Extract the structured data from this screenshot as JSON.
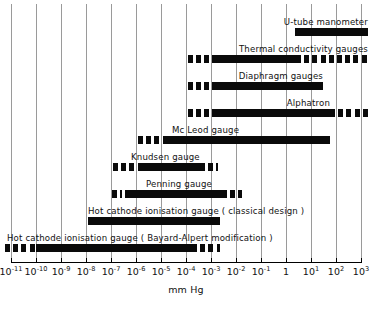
{
  "chart_data": {
    "type": "bar",
    "title": "",
    "subtitle": "",
    "xlabel": "mm Hg",
    "ylabel": "",
    "orientation": "horizontal",
    "xscale": "log",
    "xlim": [
      1e-11,
      1000.0
    ],
    "grid": true,
    "legend": "none",
    "x_ticks": [
      {
        "label": "10",
        "exponent": "-11",
        "value": 1e-11,
        "px": 11
      },
      {
        "label": "10",
        "exponent": "-10",
        "value": 1e-10,
        "px": 36
      },
      {
        "label": "10",
        "exponent": "-9",
        "value": 1e-09,
        "px": 61
      },
      {
        "label": "10",
        "exponent": "-8",
        "value": 1e-08,
        "px": 86
      },
      {
        "label": "10",
        "exponent": "-7",
        "value": 1e-07,
        "px": 111
      },
      {
        "label": "10",
        "exponent": "-6",
        "value": 1e-06,
        "px": 136
      },
      {
        "label": "10",
        "exponent": "-5",
        "value": 1e-05,
        "px": 161
      },
      {
        "label": "10",
        "exponent": "-4",
        "value": 0.0001,
        "px": 186
      },
      {
        "label": "10",
        "exponent": "-3",
        "value": 0.001,
        "px": 211
      },
      {
        "label": "10",
        "exponent": "-2",
        "value": 0.01,
        "px": 236
      },
      {
        "label": "10",
        "exponent": "-1",
        "value": 0.1,
        "px": 261
      },
      {
        "label": "1",
        "exponent": "",
        "value": 1,
        "px": 286
      },
      {
        "label": "10",
        "exponent": "1",
        "value": 10,
        "px": 311
      },
      {
        "label": "10",
        "exponent": "2",
        "value": 100,
        "px": 336
      },
      {
        "label": "10",
        "exponent": "3",
        "value": 1000,
        "px": 361
      }
    ],
    "series": [
      {
        "name": "U-tube manometer",
        "label": "U-tube manometer",
        "label_align": "right",
        "label_px": 368,
        "row_top": 14,
        "range_solid": [
          0.36,
          1000
        ],
        "range_dashed_low": null,
        "range_dashed_high": null,
        "solid_px": [
          295,
          368
        ],
        "dash_low_px": null,
        "dash_high_px": null
      },
      {
        "name": "Thermal conductivity gauges",
        "label": "Thermal conductivity gauges",
        "label_align": "right",
        "label_px": 368,
        "row_top": 41,
        "range_solid": [
          0.00016,
          1.2
        ],
        "solid_px": [
          212,
          296
        ],
        "dash_low_px": [
          188,
          212
        ],
        "dash_high_px": [
          296,
          368
        ]
      },
      {
        "name": "Diaphragm gauges",
        "label": "Diaphragm gauges",
        "label_align": "right",
        "label_px": 323,
        "row_top": 68,
        "range_solid": [
          0.00016,
          30
        ],
        "solid_px": [
          212,
          323
        ],
        "dash_low_px": [
          188,
          212
        ],
        "dash_high_px": null
      },
      {
        "name": "Alphatron",
        "label": "Alphatron",
        "label_align": "right",
        "label_px": 330,
        "row_top": 95,
        "range_solid": [
          0.00016,
          60
        ],
        "solid_px": [
          212,
          330
        ],
        "dash_low_px": [
          188,
          212
        ],
        "dash_high_px": [
          330,
          368
        ]
      },
      {
        "name": "McLeod gauge",
        "label": "Mc Leod gauge",
        "label_align": "left",
        "label_px": 172,
        "row_top": 122,
        "range_solid": [
          1e-05,
          60
        ],
        "solid_px": [
          163,
          330
        ],
        "dash_low_px": [
          138,
          163
        ],
        "dash_high_px": null
      },
      {
        "name": "Knudsen gauge",
        "label": "Knudsen gauge",
        "label_align": "left",
        "label_px": 131,
        "row_top": 149,
        "range_solid": [
          1e-06,
          0.0015
        ],
        "solid_px": [
          138,
          205
        ],
        "dash_low_px": [
          113,
          138
        ],
        "dash_high_px": [
          208,
          218
        ]
      },
      {
        "name": "Penning gauge",
        "label": "Penning gauge",
        "label_align": "left",
        "label_px": 146,
        "row_top": 176,
        "range_solid": [
          3e-07,
          0.006
        ],
        "solid_px": [
          125,
          222
        ],
        "dash_low_px": [
          112,
          122
        ],
        "dash_high_px": [
          222,
          242
        ]
      },
      {
        "name": "Hot cathode ionisation gauge (classical design)",
        "label": "Hot cathode ionisation gauge ( classical design )",
        "label_align": "left",
        "label_px": 88,
        "row_top": 203,
        "range_solid": [
          1e-08,
          0.004
        ],
        "solid_px": [
          88,
          220
        ],
        "dash_low_px": null,
        "dash_high_px": null
      },
      {
        "name": "Hot cathode ionisation gauge (Bayard-Alpert modification)",
        "label": "Hot cathode ionisation gauge  ( Bayard-Alpert modification )",
        "label_align": "left",
        "label_px": 7,
        "row_top": 230,
        "range_solid": [
          1e-10,
          0.0002
        ],
        "solid_px": [
          36,
          192
        ],
        "dash_low_px": [
          5,
          36
        ],
        "dash_high_px": [
          192,
          220
        ]
      }
    ]
  },
  "axis": {
    "title": "mm Hg",
    "left_px": 11,
    "right_px": 361,
    "baseline_px": 262
  }
}
